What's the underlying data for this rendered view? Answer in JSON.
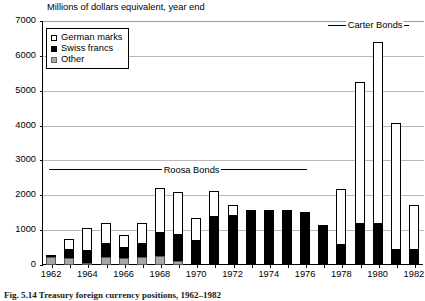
{
  "chart_data": {
    "type": "bar",
    "title": "",
    "subtitle": "Millions of dollars equivalent, year end",
    "xlabel": "",
    "ylabel": "",
    "ylim": [
      0,
      7000
    ],
    "ytick_step": 1000,
    "yticks": [
      "0",
      "1000",
      "2000",
      "3000",
      "4000",
      "5000",
      "6000",
      "7000"
    ],
    "grid": true,
    "legend_position": "top-left",
    "stacked": true,
    "categories": [
      "1962",
      "1963",
      "1964",
      "1965",
      "1966",
      "1967",
      "1968",
      "1969",
      "1970",
      "1971",
      "1972",
      "1973",
      "1974",
      "1975",
      "1976",
      "1977",
      "1978",
      "1979",
      "1980",
      "1981",
      "1982"
    ],
    "xtick_labels": [
      "1962",
      "1964",
      "1966",
      "1968",
      "1970",
      "1972",
      "1974",
      "1976",
      "1978",
      "1980",
      "1982"
    ],
    "series": [
      {
        "name": "Other",
        "color": "#a8a8a8",
        "values": [
          230,
          190,
          60,
          230,
          190,
          220,
          260,
          110,
          0,
          0,
          0,
          0,
          0,
          0,
          0,
          0,
          0,
          0,
          0,
          0,
          0
        ]
      },
      {
        "name": "Swiss francs",
        "color": "#000000",
        "values": [
          40,
          250,
          340,
          370,
          290,
          370,
          670,
          750,
          680,
          1370,
          1400,
          1570,
          1590,
          1590,
          1530,
          1160,
          580,
          1190,
          1190,
          440,
          440
        ]
      },
      {
        "name": "German marks",
        "color": "#ffffff",
        "values": [
          0,
          310,
          670,
          600,
          370,
          610,
          1290,
          1230,
          680,
          750,
          310,
          0,
          0,
          0,
          0,
          0,
          1600,
          4050,
          5220,
          3630,
          1280
        ]
      }
    ],
    "totals": [
      270,
      750,
      1070,
      1200,
      850,
      1200,
      2220,
      2090,
      1360,
      2120,
      1710,
      1570,
      1590,
      1590,
      1530,
      1160,
      2180,
      5240,
      6410,
      4070,
      1720
    ],
    "annotations": [
      {
        "label": "Roosa Bonds",
        "x_start": "1962",
        "x_end": "1976",
        "y_value": 2700
      },
      {
        "label": "Carter Bonds",
        "x_start": "1977",
        "x_end": "1982",
        "y_value": 6850
      }
    ]
  },
  "legend": {
    "items": [
      {
        "label": "German marks",
        "swatch": "open-square"
      },
      {
        "label": "Swiss francs",
        "swatch": "filled-square"
      },
      {
        "label": "Other",
        "swatch": "gray-square"
      }
    ]
  },
  "caption": {
    "text": "Fig. 5.14   Treasury foreign currency positions, 1962–1982"
  }
}
